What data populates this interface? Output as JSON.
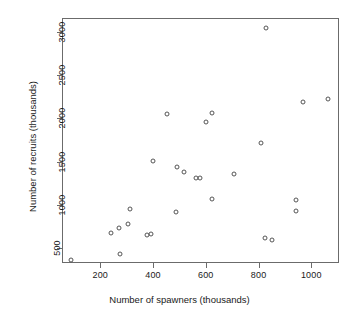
{
  "chart_data": {
    "type": "scatter",
    "title": "",
    "xlabel": "Number of spawners (thousands)",
    "ylabel": "Number of recruits (thousands)",
    "xlim": [
      55,
      1105
    ],
    "ylim": [
      330,
      3160
    ],
    "xticks": [
      200,
      400,
      600,
      800,
      1000
    ],
    "xtick_labels": [
      "200",
      "400",
      "600",
      "800",
      "1000"
    ],
    "yticks": [
      500,
      1000,
      1500,
      2000,
      2500,
      3000
    ],
    "ytick_labels": [
      "500",
      "1000",
      "1500",
      "2000",
      "2500",
      "3000"
    ],
    "grid": false,
    "legend": null,
    "marker": "open-circle",
    "marker_color": "#555555",
    "points": [
      {
        "x": 85,
        "y": 375
      },
      {
        "x": 237,
        "y": 690
      },
      {
        "x": 268,
        "y": 745
      },
      {
        "x": 272,
        "y": 440
      },
      {
        "x": 303,
        "y": 795
      },
      {
        "x": 308,
        "y": 970
      },
      {
        "x": 373,
        "y": 660
      },
      {
        "x": 390,
        "y": 675
      },
      {
        "x": 398,
        "y": 1525
      },
      {
        "x": 448,
        "y": 2060
      },
      {
        "x": 482,
        "y": 930
      },
      {
        "x": 486,
        "y": 1445
      },
      {
        "x": 514,
        "y": 1395
      },
      {
        "x": 560,
        "y": 1320
      },
      {
        "x": 574,
        "y": 1320
      },
      {
        "x": 597,
        "y": 1975
      },
      {
        "x": 618,
        "y": 2075
      },
      {
        "x": 620,
        "y": 1085
      },
      {
        "x": 703,
        "y": 1370
      },
      {
        "x": 807,
        "y": 1730
      },
      {
        "x": 821,
        "y": 625
      },
      {
        "x": 826,
        "y": 3055
      },
      {
        "x": 848,
        "y": 610
      },
      {
        "x": 937,
        "y": 1065
      },
      {
        "x": 939,
        "y": 945
      },
      {
        "x": 963,
        "y": 2205
      },
      {
        "x": 1060,
        "y": 2240
      }
    ]
  }
}
